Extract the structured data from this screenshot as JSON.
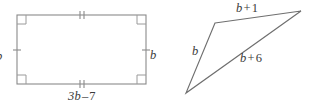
{
  "figure": {
    "line_color": "#8a8a8a",
    "text_color": "#3a3a3a",
    "background": "#ffffff"
  },
  "rectangle": {
    "name": "rectangle",
    "labels": {
      "left": "b",
      "right": "b",
      "bottom_term": "3b",
      "bottom_op": "–",
      "bottom_value": "7",
      "bottom_full": "3b – 7"
    },
    "marks": {
      "right_angle_corners": 4,
      "top_ticks": 2,
      "bottom_ticks": 2,
      "left_ticks": 1,
      "right_ticks": 1
    },
    "geometry": {
      "x": 17,
      "y": 15,
      "width": 129,
      "height": 69
    }
  },
  "triangle": {
    "name": "triangle",
    "labels": {
      "top_term": "b",
      "top_op": "+",
      "top_value": "1",
      "top_full": "b + 1",
      "left": "b",
      "hyp_term": "b",
      "hyp_op": "+",
      "hyp_value": "6",
      "hyp_full": "b + 6"
    },
    "geometry": {
      "apex": [
        215,
        23
      ],
      "right": [
        301,
        11
      ],
      "bottom": [
        186,
        93
      ]
    }
  }
}
